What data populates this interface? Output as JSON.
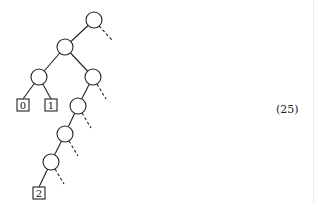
{
  "diagram": {
    "type": "binary-tree",
    "equation_label": "(25)",
    "leaves": [
      {
        "label": "0"
      },
      {
        "label": "1"
      },
      {
        "label": "2"
      }
    ],
    "internal_node_count": 7,
    "dashed_edges_count": 6,
    "colors": {
      "stroke": "#222222",
      "background": "#ffffff"
    }
  }
}
